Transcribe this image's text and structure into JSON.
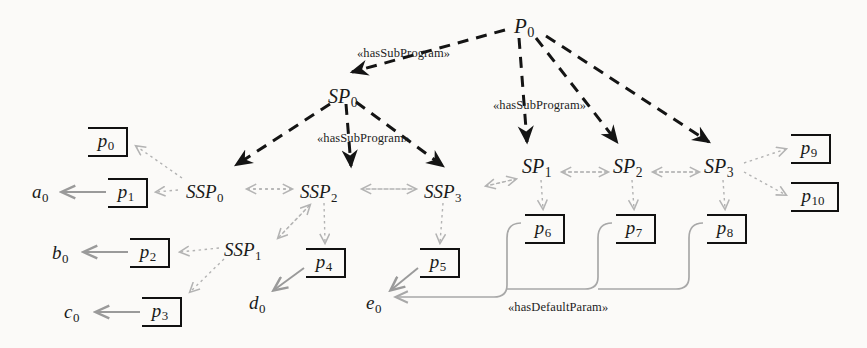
{
  "diagram": {
    "colors": {
      "ink": "#111111",
      "dashed_edge": "#1a1a1a",
      "dotted_edge": "#b3b3b3",
      "solid_gray_edge": "#9a9a9a",
      "default_param_edge": "#a8a8a8",
      "background": "#fbfaf8"
    },
    "nodes": {
      "programs": [
        {
          "id": "P0",
          "base": "P",
          "sub": "0",
          "x": 514,
          "y": 16
        }
      ],
      "subprograms": [
        {
          "id": "SP0",
          "base": "SP",
          "sub": "0",
          "x": 328,
          "y": 86
        },
        {
          "id": "SP1",
          "base": "SP",
          "sub": "1",
          "x": 522,
          "y": 156
        },
        {
          "id": "SP2",
          "base": "SP",
          "sub": "2",
          "x": 613,
          "y": 156
        },
        {
          "id": "SP3",
          "base": "SP",
          "sub": "3",
          "x": 704,
          "y": 156
        }
      ],
      "subsubprograms": [
        {
          "id": "SSP0",
          "base": "SSP",
          "sub": "0",
          "x": 186,
          "y": 182
        },
        {
          "id": "SSP1",
          "base": "SSP",
          "sub": "1",
          "x": 224,
          "y": 240
        },
        {
          "id": "SSP2",
          "base": "SSP",
          "sub": "2",
          "x": 300,
          "y": 182
        },
        {
          "id": "SSP3",
          "base": "SSP",
          "sub": "3",
          "x": 424,
          "y": 182
        }
      ],
      "parameters": [
        {
          "id": "p0",
          "base": "p",
          "sub": "0",
          "x": 88,
          "y": 127,
          "w": 40,
          "h": 30
        },
        {
          "id": "p1",
          "base": "p",
          "sub": "1",
          "x": 108,
          "y": 178,
          "w": 40,
          "h": 30
        },
        {
          "id": "p2",
          "base": "p",
          "sub": "2",
          "x": 130,
          "y": 238,
          "w": 40,
          "h": 30
        },
        {
          "id": "p3",
          "base": "p",
          "sub": "3",
          "x": 142,
          "y": 297,
          "w": 40,
          "h": 30
        },
        {
          "id": "p4",
          "base": "p",
          "sub": "4",
          "x": 306,
          "y": 248,
          "w": 40,
          "h": 30
        },
        {
          "id": "p5",
          "base": "p",
          "sub": "5",
          "x": 420,
          "y": 248,
          "w": 40,
          "h": 30
        },
        {
          "id": "p6",
          "base": "p",
          "sub": "6",
          "x": 525,
          "y": 214,
          "w": 40,
          "h": 30
        },
        {
          "id": "p7",
          "base": "p",
          "sub": "7",
          "x": 616,
          "y": 214,
          "w": 40,
          "h": 30
        },
        {
          "id": "p8",
          "base": "p",
          "sub": "8",
          "x": 707,
          "y": 214,
          "w": 40,
          "h": 30
        },
        {
          "id": "p9",
          "base": "p",
          "sub": "9",
          "x": 791,
          "y": 134,
          "w": 40,
          "h": 30
        },
        {
          "id": "p10",
          "base": "p",
          "sub": "10",
          "x": 791,
          "y": 182,
          "w": 48,
          "h": 30
        }
      ],
      "values": [
        {
          "id": "a0",
          "base": "a",
          "sub": "0",
          "x": 32,
          "y": 182
        },
        {
          "id": "b0",
          "base": "b",
          "sub": "0",
          "x": 52,
          "y": 243
        },
        {
          "id": "c0",
          "base": "c",
          "sub": "0",
          "x": 64,
          "y": 302
        },
        {
          "id": "d0",
          "base": "d",
          "sub": "0",
          "x": 249,
          "y": 293
        },
        {
          "id": "e0",
          "base": "e",
          "sub": "0",
          "x": 366,
          "y": 293
        }
      ]
    },
    "edge_labels": [
      {
        "id": "hasSubProgram-left",
        "text": "«hasSubProgram»",
        "x": 357,
        "y": 46
      },
      {
        "id": "hasSubProgram-right",
        "text": "«hasSubProgram»",
        "x": 493,
        "y": 98
      },
      {
        "id": "hasSubProgram-mid",
        "text": "«hasSubProgram»",
        "x": 317,
        "y": 131
      },
      {
        "id": "hasDefaultParam",
        "text": "«hasDefaultParam»",
        "x": 508,
        "y": 300
      }
    ],
    "relations": {
      "hasSubProgram": [
        {
          "from": "P0",
          "to": "SP0"
        },
        {
          "from": "P0",
          "to": "SP1"
        },
        {
          "from": "P0",
          "to": "SP2"
        },
        {
          "from": "P0",
          "to": "SP3"
        },
        {
          "from": "SP0",
          "to": "SSP0"
        },
        {
          "from": "SP0",
          "to": "SSP2"
        },
        {
          "from": "SP0",
          "to": "SSP3"
        }
      ],
      "hasParam": [
        {
          "from": "SSP0",
          "to": "p0"
        },
        {
          "from": "SSP0",
          "to": "p1"
        },
        {
          "from": "SSP1",
          "to": "p2"
        },
        {
          "from": "SSP1",
          "to": "p3"
        },
        {
          "from": "SSP2",
          "to": "p4"
        },
        {
          "from": "SSP3",
          "to": "p5"
        },
        {
          "from": "SP1",
          "to": "p6"
        },
        {
          "from": "SP2",
          "to": "p7"
        },
        {
          "from": "SP3",
          "to": "p8"
        },
        {
          "from": "SP3",
          "to": "p9"
        },
        {
          "from": "SP3",
          "to": "p10"
        }
      ],
      "sibling": [
        {
          "a": "SSP0",
          "b": "SSP2"
        },
        {
          "a": "SSP2",
          "b": "SSP3"
        },
        {
          "a": "SSP3",
          "b": "SP1"
        },
        {
          "a": "SP1",
          "b": "SP2"
        },
        {
          "a": "SP2",
          "b": "SP3"
        },
        {
          "a": "SSP1",
          "b": "SSP2"
        }
      ],
      "hasValue": [
        {
          "from": "p1",
          "to": "a0"
        },
        {
          "from": "p2",
          "to": "b0"
        },
        {
          "from": "p3",
          "to": "c0"
        },
        {
          "from": "p4",
          "to": "d0"
        },
        {
          "from": "p5",
          "to": "e0"
        }
      ],
      "hasDefaultParam": [
        {
          "from": "p6",
          "to": "e0"
        },
        {
          "from": "p7",
          "to": "e0"
        },
        {
          "from": "p8",
          "to": "e0"
        }
      ]
    }
  }
}
